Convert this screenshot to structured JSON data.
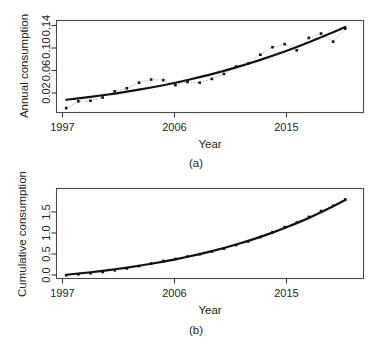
{
  "figure": {
    "panels": [
      {
        "caption": "(a)",
        "xlabel": "Year",
        "ylabel": "Annual consumption",
        "xticks": [
          "1997",
          "2006",
          "2015"
        ],
        "yticks": [
          "0.02",
          "0.06",
          "0.10",
          "0.14"
        ]
      },
      {
        "caption": "(b)",
        "xlabel": "Year",
        "ylabel": "Cumulative consumption",
        "xticks": [
          "1997",
          "2006",
          "2015"
        ],
        "yticks": [
          "0.0",
          "0.5",
          "1.0",
          "1.5"
        ]
      }
    ]
  },
  "chart_data": [
    {
      "type": "scatter",
      "title": "",
      "panel": "(a)",
      "xlabel": "Year",
      "ylabel": "Annual consumption",
      "xlim": [
        1996.2,
        2021.5
      ],
      "ylim": [
        0.004,
        0.152
      ],
      "xticks": [
        1997,
        2006,
        2015
      ],
      "yticks": [
        0.02,
        0.06,
        0.1,
        0.14
      ],
      "grid": false,
      "legend": "none",
      "x": [
        1997,
        1998,
        1999,
        2000,
        2001,
        2002,
        2003,
        2004,
        2005,
        2006,
        2007,
        2008,
        2009,
        2010,
        2011,
        2012,
        2013,
        2014,
        2015,
        2016,
        2017,
        2018,
        2019,
        2020
      ],
      "values": [
        0.011,
        0.022,
        0.023,
        0.028,
        0.038,
        0.043,
        0.052,
        0.057,
        0.056,
        0.048,
        0.053,
        0.052,
        0.058,
        0.066,
        0.078,
        0.083,
        0.097,
        0.109,
        0.114,
        0.104,
        0.124,
        0.131,
        0.118,
        0.139
      ],
      "series": [
        {
          "name": "observed",
          "style": "points",
          "values": [
            0.011,
            0.022,
            0.023,
            0.028,
            0.038,
            0.043,
            0.052,
            0.057,
            0.056,
            0.048,
            0.053,
            0.052,
            0.058,
            0.066,
            0.078,
            0.083,
            0.097,
            0.109,
            0.114,
            0.104,
            0.124,
            0.131,
            0.118,
            0.139
          ]
        },
        {
          "name": "fitted",
          "style": "line",
          "values": [
            0.0245,
            0.0267,
            0.0291,
            0.0317,
            0.0345,
            0.0375,
            0.0407,
            0.0442,
            0.0479,
            0.0519,
            0.0562,
            0.0608,
            0.0657,
            0.0709,
            0.0765,
            0.0824,
            0.0886,
            0.0952,
            0.1021,
            0.1094,
            0.117,
            0.1249,
            0.1331,
            0.1416
          ]
        }
      ]
    },
    {
      "type": "line",
      "title": "",
      "panel": "(b)",
      "xlabel": "Year",
      "ylabel": "Cumulative consumption",
      "xlim": [
        1996.2,
        2021.5
      ],
      "ylim": [
        -0.06,
        1.95
      ],
      "xticks": [
        1997,
        2006,
        2015
      ],
      "yticks": [
        0.0,
        0.5,
        1.0,
        1.5
      ],
      "grid": false,
      "legend": "none",
      "x": [
        1997,
        1998,
        1999,
        2000,
        2001,
        2002,
        2003,
        2004,
        2005,
        2006,
        2007,
        2008,
        2009,
        2010,
        2011,
        2012,
        2013,
        2014,
        2015,
        2016,
        2017,
        2018,
        2019,
        2020
      ],
      "values": [
        0.011,
        0.033,
        0.056,
        0.084,
        0.122,
        0.165,
        0.217,
        0.274,
        0.33,
        0.378,
        0.431,
        0.483,
        0.541,
        0.607,
        0.685,
        0.768,
        0.865,
        0.974,
        1.088,
        1.192,
        1.316,
        1.447,
        1.565,
        1.704
      ],
      "series": [
        {
          "name": "observed",
          "style": "points",
          "values": [
            0.011,
            0.033,
            0.056,
            0.084,
            0.122,
            0.165,
            0.217,
            0.274,
            0.33,
            0.378,
            0.431,
            0.483,
            0.541,
            0.607,
            0.685,
            0.768,
            0.865,
            0.974,
            1.088,
            1.192,
            1.316,
            1.447,
            1.565,
            1.704
          ]
        },
        {
          "name": "fitted",
          "style": "line",
          "values": [
            0.0245,
            0.0512,
            0.0803,
            0.112,
            0.1465,
            0.184,
            0.2247,
            0.2689,
            0.3168,
            0.3687,
            0.4249,
            0.4857,
            0.5514,
            0.6223,
            0.6988,
            0.7812,
            0.8698,
            0.965,
            1.0671,
            1.1765,
            1.2935,
            1.4184,
            1.5515,
            1.6931
          ]
        }
      ]
    }
  ]
}
